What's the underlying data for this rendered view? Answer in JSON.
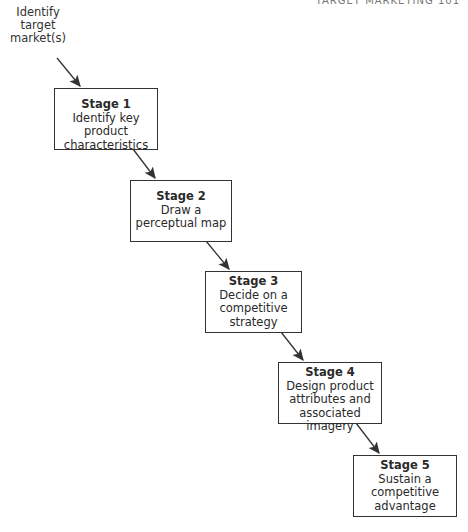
{
  "header": {
    "text": "TARGET MARKETING 101"
  },
  "start": {
    "lines": [
      "Identify",
      "target",
      "market(s)"
    ]
  },
  "stages": [
    {
      "title": "Stage 1",
      "lines": [
        "Identify key product",
        "characteristics"
      ]
    },
    {
      "title": "Stage 2",
      "lines": [
        "Draw a",
        "perceptual map"
      ]
    },
    {
      "title": "Stage 3",
      "lines": [
        "Decide on a",
        "competitive",
        "strategy"
      ]
    },
    {
      "title": "Stage 4",
      "lines": [
        "Design product",
        "attributes and",
        "associated imagery"
      ]
    },
    {
      "title": "Stage 5",
      "lines": [
        "Sustain a",
        "competitive",
        "advantage"
      ]
    }
  ],
  "colors": {
    "line": "#333333",
    "text": "#2a2a2a"
  }
}
